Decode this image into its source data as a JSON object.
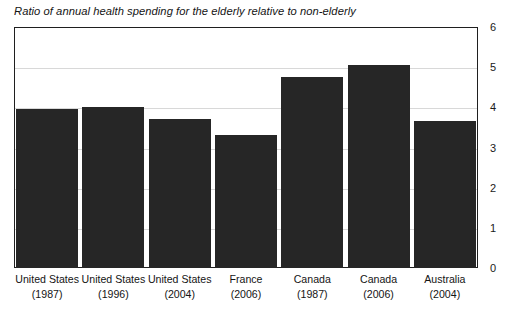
{
  "chart_data": {
    "type": "bar",
    "title": "Ratio of annual health spending for the elderly relative to non-elderly",
    "xlabel": "",
    "ylabel": "",
    "ylim": [
      0,
      6
    ],
    "yticks": [
      "0",
      "1",
      "2",
      "3",
      "4",
      "5",
      "6"
    ],
    "grid": true,
    "legend": "none",
    "y_axis_position": "right",
    "bar_color": "#262626",
    "gridline_color": "#d8d8d8",
    "frame_color": "#1f1f1f",
    "categories": [
      "United States (1987)",
      "United States (1996)",
      "United States (2004)",
      "France (2006)",
      "Canada (1987)",
      "Canada (2006)",
      "Australia (2004)"
    ],
    "category_labels": [
      {
        "name": "United States",
        "year": "(1987)"
      },
      {
        "name": "United States",
        "year": "(1996)"
      },
      {
        "name": "United States",
        "year": "(2004)"
      },
      {
        "name": "France",
        "year": "(2006)"
      },
      {
        "name": "Canada",
        "year": "(1987)"
      },
      {
        "name": "Canada",
        "year": "(2006)"
      },
      {
        "name": "Australia",
        "year": "(2004)"
      }
    ],
    "values": [
      3.96,
      4.02,
      3.7,
      3.3,
      4.75,
      5.05,
      3.65
    ]
  }
}
